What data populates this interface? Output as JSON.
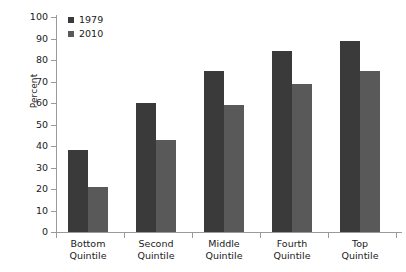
{
  "chart_data": {
    "type": "bar",
    "title": "",
    "xlabel": "",
    "ylabel": "Percent",
    "ylim": [
      0,
      100
    ],
    "ytick_step": 10,
    "yticks": [
      0,
      10,
      20,
      30,
      40,
      50,
      60,
      70,
      80,
      90,
      100
    ],
    "grid": false,
    "legend_position": "top-left",
    "categories": [
      "Bottom\nQuintile",
      "Second\nQuintile",
      "Middle\nQuintile",
      "Fourth\nQuintile",
      "Top\nQuintile"
    ],
    "category_lines": [
      [
        "Bottom",
        "Quintile"
      ],
      [
        "Second",
        "Quintile"
      ],
      [
        "Middle",
        "Quintile"
      ],
      [
        "Fourth",
        "Quintile"
      ],
      [
        "Top",
        "Quintile"
      ]
    ],
    "series": [
      {
        "name": "1979",
        "color": "#3a3a3a",
        "values": [
          38,
          60,
          75,
          84,
          89
        ]
      },
      {
        "name": "2010",
        "color": "#595959",
        "values": [
          21,
          43,
          59,
          69,
          75
        ]
      }
    ]
  },
  "legend": {
    "items": [
      {
        "label": "1979",
        "color": "#3a3a3a"
      },
      {
        "label": "2010",
        "color": "#595959"
      }
    ]
  },
  "colors": {
    "series_1979": "#3a3a3a",
    "series_2010": "#595959",
    "axis": "#9a9a9a",
    "text": "#1a1a1a",
    "background": "#ffffff"
  }
}
